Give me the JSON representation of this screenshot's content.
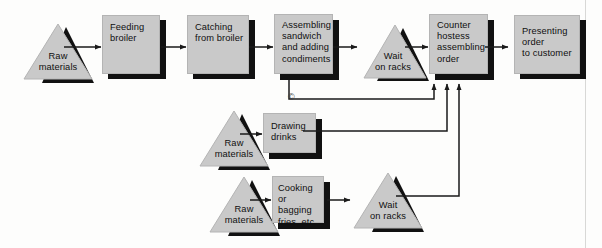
{
  "diagram": {
    "type": "process-flowchart",
    "colors": {
      "shape_fill": "#c9c9c9",
      "shadow": "#111111",
      "line": "#1a1a1a",
      "text": "#101010",
      "background": "#fdfdfc"
    },
    "copyright_mark": "©",
    "rows": [
      {
        "id": "sandwich-line",
        "name": "Sandwich preparation line",
        "nodes": [
          {
            "id": "raw-materials-sandwich",
            "shape": "triangle",
            "label": "Raw\nmaterials",
            "line1": "Raw",
            "line2": "materials"
          },
          {
            "id": "feeding-broiler",
            "shape": "box",
            "label": "Feeding\nbroiler",
            "line1": "Feeding",
            "line2": "broiler"
          },
          {
            "id": "catching-from-broiler",
            "shape": "box",
            "label": "Catching\nfrom broiler",
            "line1": "Catching",
            "line2": "from broiler"
          },
          {
            "id": "assembling-sandwich",
            "shape": "box",
            "label": "Assembling sandwich and adding condiments",
            "line1": "Assembling",
            "line2": "sandwich",
            "line3": "and adding",
            "line4": "condiments"
          },
          {
            "id": "wait-on-racks-sandwich",
            "shape": "triangle",
            "label": "Wait\non racks",
            "line1": "Wait",
            "line2": "on racks"
          },
          {
            "id": "counter-hostess",
            "shape": "box",
            "label": "Counter hostess assembling order",
            "line1": "Counter",
            "line2": "hostess",
            "line3": "assembling",
            "line4": "order"
          },
          {
            "id": "presenting-order",
            "shape": "box",
            "label": "Presenting order to customer",
            "line1": "Presenting",
            "line2": "order",
            "line3": "to customer"
          }
        ]
      },
      {
        "id": "drinks-line",
        "name": "Drinks line",
        "nodes": [
          {
            "id": "raw-materials-drinks",
            "shape": "triangle",
            "label": "Raw\nmaterials",
            "line1": "Raw",
            "line2": "materials"
          },
          {
            "id": "drawing-drinks",
            "shape": "box",
            "label": "Drawing drinks",
            "line1": "Drawing",
            "line2": "drinks"
          }
        ]
      },
      {
        "id": "fries-line",
        "name": "Fries line",
        "nodes": [
          {
            "id": "raw-materials-fries",
            "shape": "triangle",
            "label": "Raw\nmaterials",
            "line1": "Raw",
            "line2": "materials"
          },
          {
            "id": "cooking-bagging-fries",
            "shape": "box",
            "label": "Cooking or bagging fries, etc.",
            "line1": "Cooking or",
            "line2": "bagging",
            "line3": "fries, etc."
          },
          {
            "id": "wait-on-racks-fries",
            "shape": "triangle",
            "label": "Wait\non racks",
            "line1": "Wait",
            "line2": "on racks"
          }
        ]
      }
    ],
    "connections": [
      {
        "from": "raw-materials-sandwich",
        "to": "feeding-broiler"
      },
      {
        "from": "feeding-broiler",
        "to": "catching-from-broiler"
      },
      {
        "from": "catching-from-broiler",
        "to": "assembling-sandwich"
      },
      {
        "from": "assembling-sandwich",
        "to": "wait-on-racks-sandwich"
      },
      {
        "from": "wait-on-racks-sandwich",
        "to": "counter-hostess"
      },
      {
        "from": "counter-hostess",
        "to": "presenting-order"
      },
      {
        "from": "assembling-sandwich",
        "to": "counter-hostess"
      },
      {
        "from": "raw-materials-drinks",
        "to": "drawing-drinks"
      },
      {
        "from": "drawing-drinks",
        "to": "counter-hostess"
      },
      {
        "from": "raw-materials-fries",
        "to": "cooking-bagging-fries"
      },
      {
        "from": "cooking-bagging-fries",
        "to": "wait-on-racks-fries"
      },
      {
        "from": "wait-on-racks-fries",
        "to": "counter-hostess"
      }
    ]
  }
}
